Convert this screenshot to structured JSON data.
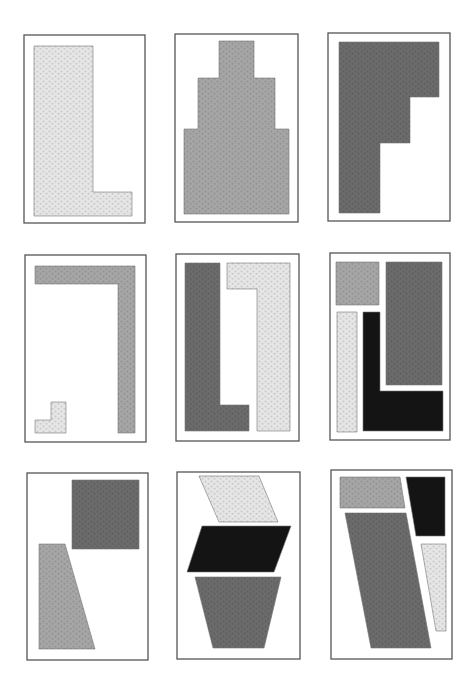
{
  "colors": {
    "light": "#e6e6e6",
    "mid": "#a6a6a6",
    "dark": "#6b6b6b",
    "black": "#141414",
    "frame": "#555555"
  },
  "panels": [
    {
      "id": "panel-1",
      "row": 1,
      "col": 1,
      "frame": [
        24,
        35,
        121,
        188
      ],
      "shapes": [
        {
          "name": "l-shape",
          "fill": "light",
          "points": "34,46 93,46 93,192 132,192 132,216 34,216"
        }
      ]
    },
    {
      "id": "panel-2",
      "row": 1,
      "col": 2,
      "frame": [
        175,
        34,
        123,
        188
      ],
      "shapes": [
        {
          "name": "stepped-tower-shape",
          "fill": "mid",
          "points": "219,41 254,41 254,78 275,78 275,129 289,129 289,214 184,214 184,129 198,129 198,78 219,78"
        }
      ]
    },
    {
      "id": "panel-3",
      "row": 1,
      "col": 3,
      "frame": [
        328,
        33,
        122,
        188
      ],
      "shapes": [
        {
          "name": "stepped-l-shape",
          "fill": "dark",
          "points": "339,42 439,42 439,97 410,97 410,143 380,143 380,213 339,213"
        }
      ]
    },
    {
      "id": "panel-4",
      "row": 2,
      "col": 1,
      "frame": [
        25,
        255,
        121,
        187
      ],
      "shapes": [
        {
          "name": "inverted-l-bar",
          "fill": "mid",
          "points": "35,266 135,266 135,433 118,433 118,284 35,284"
        },
        {
          "name": "small-l-shape",
          "fill": "light",
          "points": "51,402 66,402 66,433 35,433 35,420 51,420"
        }
      ]
    },
    {
      "id": "panel-5",
      "row": 2,
      "col": 2,
      "frame": [
        176,
        254,
        123,
        187
      ],
      "shapes": [
        {
          "name": "dark-l-shape",
          "fill": "dark",
          "points": "185,263 220,263 220,405 249,405 249,431 185,431"
        },
        {
          "name": "light-hook-shape",
          "fill": "light",
          "points": "227,263 290,263 290,431 257,431 257,289 227,289"
        }
      ]
    },
    {
      "id": "panel-6",
      "row": 2,
      "col": 3,
      "frame": [
        330,
        253,
        120,
        187
      ],
      "shapes": [
        {
          "name": "mid-square",
          "fill": "mid",
          "points": "336,262 379,262 379,305 336,305"
        },
        {
          "name": "dark-rectangle",
          "fill": "dark",
          "points": "386,262 442,262 442,385 386,385"
        },
        {
          "name": "light-bar",
          "fill": "light",
          "points": "337,312 357,312 357,432 337,432"
        },
        {
          "name": "black-l-shape",
          "fill": "black",
          "points": "363,312 380,312 380,391 443,391 443,431 363,431"
        }
      ]
    },
    {
      "id": "panel-7",
      "row": 3,
      "col": 1,
      "frame": [
        27,
        473,
        121,
        187
      ],
      "shapes": [
        {
          "name": "dark-square",
          "fill": "dark",
          "points": "72,480 139,480 139,549 72,549"
        },
        {
          "name": "mid-trapezoid",
          "fill": "mid",
          "points": "39,544 65,544 95,649 39,649"
        }
      ]
    },
    {
      "id": "panel-8",
      "row": 3,
      "col": 2,
      "frame": [
        177,
        472,
        123,
        187
      ],
      "shapes": [
        {
          "name": "light-parallelogram",
          "fill": "light",
          "points": "199,476 259,476 278,522 219,522"
        },
        {
          "name": "black-parallelogram",
          "fill": "black",
          "points": "202,526 291,526 274,572 187,572"
        },
        {
          "name": "dark-trapezoid",
          "fill": "dark",
          "points": "195,577 281,577 264,648 213,648"
        }
      ]
    },
    {
      "id": "panel-9",
      "row": 3,
      "col": 3,
      "frame": [
        331,
        470,
        121,
        189
      ],
      "shapes": [
        {
          "name": "mid-quadrilateral",
          "fill": "mid",
          "points": "340,477 400,477 405,508 340,508"
        },
        {
          "name": "black-quadrilateral",
          "fill": "black",
          "points": "406,477 445,477 445,536 416,536"
        },
        {
          "name": "dark-slanted-shape",
          "fill": "dark",
          "points": "345,513 406,513 431,648 371,648"
        },
        {
          "name": "light-wedge",
          "fill": "light",
          "points": "421,544 446,544 446,631 436,631"
        }
      ]
    }
  ]
}
